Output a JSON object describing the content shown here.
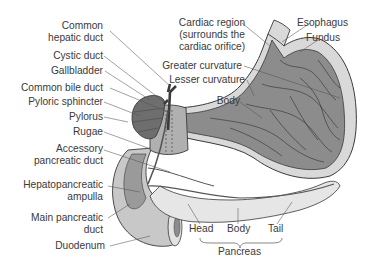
{
  "colors": {
    "stomach_wall": "#d9d9d9",
    "stomach_inner": "#8c8c8c",
    "gallbladder": "#6e6e6e",
    "duodenum": "#c8c8c8",
    "pancreas": "#e6e6e6",
    "outline": "#3a3a3a",
    "leader": "#555555",
    "text": "#3a3a3a"
  },
  "labels_left": [
    {
      "id": "common-hepatic-duct",
      "lines": [
        "Common",
        "hepatic duct"
      ]
    },
    {
      "id": "cystic-duct",
      "lines": [
        "Cystic duct"
      ]
    },
    {
      "id": "gallbladder",
      "lines": [
        "Gallbladder"
      ]
    },
    {
      "id": "common-bile-duct",
      "lines": [
        "Common bile duct"
      ]
    },
    {
      "id": "pyloric-sphincter",
      "lines": [
        "Pyloric sphincter"
      ]
    },
    {
      "id": "pylorus",
      "lines": [
        "Pylorus"
      ]
    },
    {
      "id": "rugae",
      "lines": [
        "Rugae"
      ]
    },
    {
      "id": "accessory-pancreatic-duct",
      "lines": [
        "Accessory",
        "pancreatic duct"
      ]
    },
    {
      "id": "hepatopancreatic-ampulla",
      "lines": [
        "Hepatopancreatic",
        "ampulla"
      ]
    },
    {
      "id": "main-pancreatic-duct",
      "lines": [
        "Main pancreatic",
        "duct"
      ]
    },
    {
      "id": "duodenum",
      "lines": [
        "Duodenum"
      ]
    }
  ],
  "labels_right": [
    {
      "id": "cardiac-region",
      "lines": [
        "Cardiac region",
        "(surrounds the",
        "cardiac orifice)"
      ]
    },
    {
      "id": "esophagus",
      "lines": [
        "Esophagus"
      ]
    },
    {
      "id": "fundus",
      "lines": [
        "Fundus"
      ]
    },
    {
      "id": "greater-curvature",
      "lines": [
        "Greater curvature"
      ]
    },
    {
      "id": "lesser-curvature",
      "lines": [
        "Lesser curvature"
      ]
    },
    {
      "id": "body",
      "lines": [
        "Body"
      ]
    }
  ],
  "labels_bottom": [
    {
      "id": "pancreas-head",
      "lines": [
        "Head"
      ]
    },
    {
      "id": "pancreas-body",
      "lines": [
        "Body"
      ]
    },
    {
      "id": "pancreas-tail",
      "lines": [
        "Tail"
      ]
    },
    {
      "id": "pancreas",
      "lines": [
        "Pancreas"
      ]
    }
  ],
  "text": {
    "common": "Common",
    "hepatic_duct": "hepatic duct",
    "cystic_duct": "Cystic duct",
    "gallbladder": "Gallbladder",
    "common_bile_duct": "Common bile duct",
    "pyloric_sphincter": "Pyloric sphincter",
    "pylorus": "Pylorus",
    "rugae": "Rugae",
    "accessory": "Accessory",
    "pancreatic_duct": "pancreatic duct",
    "hepatopancreatic": "Hepatopancreatic",
    "ampulla": "ampulla",
    "main_pancreatic": "Main pancreatic",
    "duct": "duct",
    "duodenum": "Duodenum",
    "cardiac_region": "Cardiac region",
    "surrounds_the": "(surrounds the",
    "cardiac_orifice": "cardiac orifice)",
    "esophagus": "Esophagus",
    "fundus": "Fundus",
    "greater_curvature": "Greater curvature",
    "lesser_curvature": "Lesser curvature",
    "body": "Body",
    "head": "Head",
    "pbody": "Body",
    "tail": "Tail",
    "pancreas": "Pancreas"
  }
}
